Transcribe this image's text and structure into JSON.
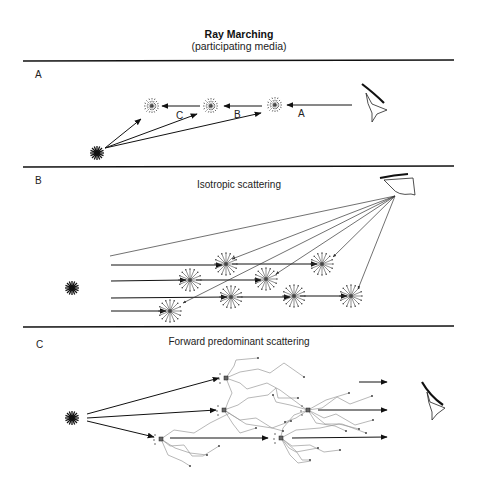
{
  "header": {
    "title": "Ray Marching",
    "subtitle": "(participating media)"
  },
  "panels": [
    {
      "id": "A",
      "label": "A",
      "heading": "",
      "segment_labels": [
        "A",
        "B",
        "C"
      ],
      "elements": [
        "light-source",
        "3 sample points",
        "eye/camera"
      ]
    },
    {
      "id": "B",
      "label": "B",
      "heading": "Isotropic scattering",
      "elements": [
        "light-source",
        "4 parallel light rays",
        "8 scattering points",
        "5 view rays from eye"
      ]
    },
    {
      "id": "C",
      "label": "C",
      "heading": "Forward predominant scattering",
      "elements": [
        "light-source",
        "5 scattering points",
        "forward arrows toward eye",
        "eye/camera"
      ]
    }
  ],
  "colors": {
    "line": "#111111",
    "scatter_path": "#999999",
    "background": "#ffffff"
  }
}
